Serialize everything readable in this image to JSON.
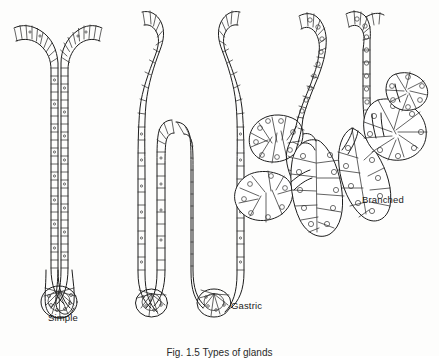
{
  "figure": {
    "caption": "Fig. 1.5 Types of glands",
    "background_color": "#fdfdfc",
    "ink_color": "#1a1a1a",
    "labels": {
      "simple": "Simple",
      "gastric": "Gastric",
      "branched": "Branched"
    },
    "panels": [
      {
        "name": "simple",
        "label": "Simple",
        "description": "Simple tubular gland: a single straight unbranched tube lined by a ladder of narrow columnar epithelial cells, curving at the top opening and ending in a rounded blind sac.",
        "label_position": {
          "x": 48,
          "y": 312
        }
      },
      {
        "name": "gastric",
        "label": "Gastric",
        "description": "Gastric gland: a wide tubular gland whose lumen divides into two blind-ending tubules, all lined with columnar epithelium drawn as rungs.",
        "label_position": {
          "x": 231,
          "y": 300
        }
      },
      {
        "name": "branched",
        "label": "Branched",
        "description": "Branched (compound acinar) gland: a duct dividing repeatedly into lobed acini built from wedge-shaped secretory cells each containing a round nucleus.",
        "label_position": {
          "x": 362,
          "y": 194
        }
      }
    ]
  }
}
